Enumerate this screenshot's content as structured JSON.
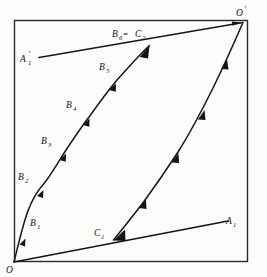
{
  "figure": {
    "background_color": "#fcfcfb",
    "line_color": "#1a1a1a",
    "frame": {
      "x": 14,
      "y": 20,
      "width": 234,
      "height": 242
    },
    "labels": {
      "origin": "O",
      "origin_prime": "O",
      "origin_prime_mark": "'",
      "a1": "A",
      "a1_sub": "1",
      "a1_prime": "A",
      "a1_prime_mark": "'",
      "a1_prime_sub": "1",
      "b1": "B",
      "b1_sub": "1",
      "b2": "B",
      "b2_sub": "2",
      "b3": "B",
      "b3_sub": "3",
      "b4": "B",
      "b4_sub": "4",
      "b5": "B",
      "b5_sub": "5",
      "b6": "B",
      "b6_sub": "6",
      "equals": " = ",
      "c2": "C",
      "c2_sub": "2",
      "c1": "C",
      "c1_sub": "1"
    },
    "points": {
      "O": [
        14,
        262
      ],
      "O_prime": [
        244,
        22
      ],
      "A1": [
        226,
        222
      ],
      "A1_prime": [
        40,
        57
      ],
      "B1": [
        27,
        212
      ],
      "B2": [
        44,
        183
      ],
      "B3": [
        66,
        150
      ],
      "B4": [
        90,
        115
      ],
      "B5": [
        117,
        80
      ],
      "B6_C2": [
        150,
        45
      ],
      "C1": [
        114,
        240
      ]
    },
    "curves": {
      "left_curve": "O -> B1 -> B2 -> B3 -> B4 -> B5 -> B6=C2",
      "right_curve": "C1 -> O'",
      "ray_upper": "A'1 -> O'",
      "ray_lower": "O -> A1"
    },
    "tick_count": {
      "left_curve": 6,
      "right_curve": 5,
      "ray_upper": 1,
      "ray_lower": 0
    }
  }
}
